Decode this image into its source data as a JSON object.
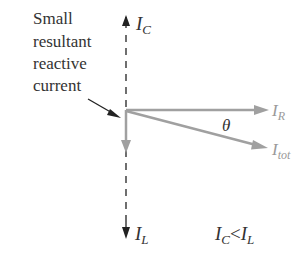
{
  "annotation": {
    "lines": [
      "Small",
      "resultant",
      "reactive",
      "current"
    ]
  },
  "axis": {
    "top_label": {
      "main": "I",
      "sub": "C"
    },
    "bottom_label": {
      "main": "I",
      "sub": "L"
    }
  },
  "vectors": {
    "resistive": {
      "main": "I",
      "sub": "R"
    },
    "total": {
      "main": "I",
      "sub": "tot"
    },
    "angle": "θ"
  },
  "condition": {
    "left_main": "I",
    "left_sub": "C",
    "operator": "<",
    "right_main": "I",
    "right_sub": "L"
  },
  "colors": {
    "axis": "#222222",
    "vector": "#a0a0a0",
    "text": "#333333",
    "vector_label": "#9a9a9a"
  }
}
